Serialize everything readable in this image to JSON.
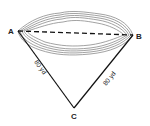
{
  "diagram": {
    "points": {
      "A": {
        "label": "A",
        "x": 18,
        "y": 31
      },
      "B": {
        "label": "B",
        "x": 133,
        "y": 35
      },
      "C": {
        "label": "C",
        "x": 74,
        "y": 108
      }
    },
    "edges": [
      {
        "from": "A",
        "to": "B",
        "style": "dashed"
      },
      {
        "from": "A",
        "to": "C",
        "style": "solid",
        "label": "80 yd"
      },
      {
        "from": "B",
        "to": "C",
        "style": "solid",
        "label": "80 yd"
      }
    ],
    "labels": {
      "a": "A",
      "b": "B",
      "c": "C",
      "ac_length": "80 yd",
      "bc_length": "80 yd"
    },
    "colors": {
      "line": "#111111",
      "water_outline": "#8a8a8a"
    }
  }
}
